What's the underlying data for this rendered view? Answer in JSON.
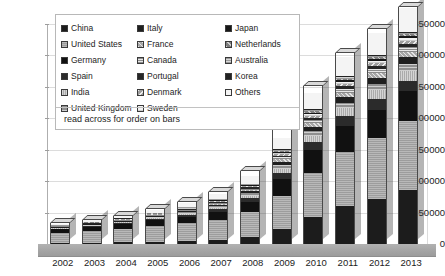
{
  "chart_data": {
    "type": "bar",
    "subtype": "stacked-column-3d",
    "title": "",
    "xlabel": "",
    "ylabel": "",
    "ylim": [
      0,
      350000
    ],
    "ytick_step": 50000,
    "ytick_labels": [
      "350000",
      "300000",
      "250000",
      "200000",
      "150000",
      "100000",
      "50000",
      "0"
    ],
    "grid": true,
    "legend_position": "inside-top-left",
    "legend_note": "read across for order on bars",
    "categories": [
      "2002",
      "2003",
      "2004",
      "2005",
      "2006",
      "2007",
      "2008",
      "2009",
      "2010",
      "2011",
      "2012",
      "2013"
    ],
    "series": [
      {
        "name": "China",
        "key": "china",
        "values": [
          1500,
          2000,
          2600,
          3500,
          5000,
          7000,
          11000,
          24000,
          43000,
          60000,
          72000,
          86000
        ]
      },
      {
        "name": "United States",
        "key": "us",
        "values": [
          16000,
          18500,
          21000,
          25000,
          28000,
          32000,
          40000,
          53000,
          70000,
          86000,
          97000,
          110000
        ]
      },
      {
        "name": "Germany",
        "key": "germany",
        "values": [
          6000,
          7000,
          8000,
          9000,
          10500,
          12500,
          16000,
          27000,
          36000,
          42000,
          45000,
          47000
        ]
      },
      {
        "name": "Spain",
        "key": "spain",
        "values": [
          1000,
          1200,
          1500,
          2000,
          2600,
          3500,
          5500,
          9000,
          13000,
          15500,
          16500,
          17000
        ]
      },
      {
        "name": "India",
        "key": "india",
        "values": [
          900,
          1100,
          1400,
          1800,
          2300,
          3000,
          4500,
          7000,
          10000,
          12500,
          14000,
          16000
        ]
      },
      {
        "name": "United Kingdom",
        "key": "uk",
        "values": [
          800,
          950,
          1100,
          1400,
          1800,
          2400,
          3500,
          5500,
          7500,
          9000,
          10000,
          11000
        ]
      },
      {
        "name": "Italy",
        "key": "italy",
        "values": [
          700,
          850,
          1000,
          1300,
          1700,
          2200,
          3200,
          5000,
          7000,
          8500,
          9500,
          10500
        ]
      },
      {
        "name": "France",
        "key": "france",
        "values": [
          600,
          720,
          880,
          1100,
          1400,
          1800,
          2600,
          4200,
          5800,
          7000,
          7800,
          8500
        ]
      },
      {
        "name": "Canada",
        "key": "canada",
        "values": [
          500,
          600,
          730,
          900,
          1150,
          1500,
          2100,
          3400,
          4700,
          5700,
          6300,
          6900
        ]
      },
      {
        "name": "Portugal",
        "key": "portugal",
        "values": [
          420,
          500,
          610,
          760,
          960,
          1250,
          1750,
          2800,
          3900,
          4700,
          5200,
          5700
        ]
      },
      {
        "name": "Denmark",
        "key": "denmark",
        "values": [
          360,
          430,
          520,
          650,
          820,
          1060,
          1480,
          2400,
          3300,
          4000,
          4400,
          4800
        ]
      },
      {
        "name": "Sweden",
        "key": "sweden",
        "values": [
          300,
          360,
          440,
          550,
          690,
          890,
          1240,
          2000,
          2750,
          3350,
          3700,
          4050
        ]
      },
      {
        "name": "Japan",
        "key": "japan",
        "values": [
          260,
          310,
          375,
          465,
          585,
          755,
          1050,
          1700,
          2350,
          2850,
          3150,
          3450
        ]
      },
      {
        "name": "Netherlands",
        "key": "netherlands",
        "values": [
          220,
          260,
          315,
          390,
          490,
          635,
          880,
          1430,
          1970,
          2390,
          2640,
          2890
        ]
      },
      {
        "name": "Australia",
        "key": "australia",
        "values": [
          185,
          220,
          265,
          330,
          415,
          535,
          745,
          1205,
          1660,
          2015,
          2225,
          2435
        ]
      },
      {
        "name": "Korea",
        "key": "korea",
        "values": [
          155,
          185,
          222,
          277,
          348,
          449,
          625,
          1011,
          1393,
          1691,
          1867,
          2043
        ]
      },
      {
        "name": "Others",
        "key": "others",
        "values": [
          2800,
          3400,
          4100,
          5100,
          6400,
          8300,
          11500,
          18600,
          25600,
          31100,
          34300,
          37500
        ]
      }
    ],
    "totals": [
      32700,
      37985,
      45055,
      55527,
      66808,
      83274,
      115625,
      190246,
      251880,
      304297,
      341845,
      377218
    ]
  },
  "legend": {
    "columns": 3,
    "entries": [
      {
        "label": "China",
        "key": "china"
      },
      {
        "label": "United States",
        "key": "us"
      },
      {
        "label": "Germany",
        "key": "germany"
      },
      {
        "label": "Spain",
        "key": "spain"
      },
      {
        "label": "India",
        "key": "india"
      },
      {
        "label": "United Kingdom",
        "key": "uk"
      },
      {
        "label": "Italy",
        "key": "italy"
      },
      {
        "label": "France",
        "key": "france"
      },
      {
        "label": "Canada",
        "key": "canada"
      },
      {
        "label": "Portugal",
        "key": "portugal"
      },
      {
        "label": "Denmark",
        "key": "denmark"
      },
      {
        "label": "Sweden",
        "key": "sweden"
      },
      {
        "label": "Japan",
        "key": "japan"
      },
      {
        "label": "Netherlands",
        "key": "netherlands"
      },
      {
        "label": "Australia",
        "key": "australia"
      },
      {
        "label": "Korea",
        "key": "korea"
      },
      {
        "label": "Others",
        "key": "others"
      }
    ],
    "note": "read across for order on bars"
  },
  "colors": {
    "background": "#ffffff",
    "gridline": "#dcdcdc",
    "axis": "#9a9a9a",
    "floor": "#a3a3a3",
    "text": "#1a1a1a",
    "legend_border": "#b8b8b8"
  }
}
